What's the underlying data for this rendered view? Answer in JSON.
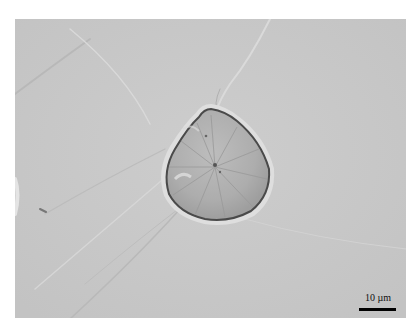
{
  "figure": {
    "background_color": "#c9c9c9",
    "particle_fill": "#b3b3b3",
    "particle_edge": "#4a4a4a"
  },
  "scale_bar": {
    "label": "10 µm",
    "color": "#000000"
  }
}
